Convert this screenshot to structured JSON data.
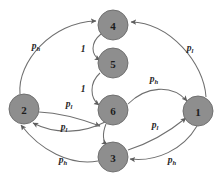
{
  "figure": {
    "type": "directed-graph-diagram",
    "background_color": "#ffffff",
    "node_fill_color": "#8e8e8e",
    "node_stroke_color": "#6a6a6a",
    "edge_color": "#6f6f6f",
    "label_color": "#262626"
  },
  "nodes": [
    {
      "id": "4",
      "label": "4",
      "x": 113,
      "y": 25,
      "r": 15
    },
    {
      "id": "5",
      "label": "5",
      "x": 113,
      "y": 63,
      "r": 15
    },
    {
      "id": "6",
      "label": "6",
      "x": 113,
      "y": 110,
      "r": 15
    },
    {
      "id": "2",
      "label": "2",
      "x": 24,
      "y": 109,
      "r": 15
    },
    {
      "id": "1",
      "label": "1",
      "x": 198,
      "y": 111,
      "r": 15
    },
    {
      "id": "3",
      "label": "3",
      "x": 113,
      "y": 157,
      "r": 15
    }
  ],
  "edges": [
    {
      "from": "2",
      "to": "4",
      "label_base": "p",
      "label_sub": "h",
      "label_x": 36,
      "label_y": 46
    },
    {
      "from": "1",
      "to": "4",
      "label_base": "p",
      "label_sub": "l",
      "label_x": 190,
      "label_y": 48
    },
    {
      "from": "4",
      "to": "5",
      "label_base": "1",
      "label_sub": "",
      "label_x": 83,
      "label_y": 49
    },
    {
      "from": "5",
      "to": "6",
      "label_base": "1",
      "label_sub": "",
      "label_x": 83,
      "label_y": 89
    },
    {
      "from": "6",
      "to": "1",
      "label_base": "p",
      "label_sub": "h",
      "label_x": 154,
      "label_y": 79
    },
    {
      "from": "2",
      "to": "6",
      "label_base": "p",
      "label_sub": "l",
      "label_x": 69,
      "label_y": 104
    },
    {
      "from": "6",
      "to": "2",
      "label_base": "p",
      "label_sub": "l",
      "label_x": 64,
      "label_y": 127
    },
    {
      "from": "3",
      "to": "1",
      "label_base": "p",
      "label_sub": "l",
      "label_x": 155,
      "label_y": 125
    },
    {
      "from": "3",
      "to": "2",
      "label_base": "p",
      "label_sub": "h",
      "label_x": 63,
      "label_y": 160
    },
    {
      "from": "1",
      "to": "3",
      "label_base": "p",
      "label_sub": "h",
      "label_x": 172,
      "label_y": 160
    },
    {
      "from": "6",
      "to": "3",
      "label_base": "",
      "label_sub": "",
      "label_x": 0,
      "label_y": 0
    }
  ],
  "edge_labels": {
    "p_high": "p",
    "p_high_sub": "h",
    "p_low": "p",
    "p_low_sub": "l",
    "one": "1"
  }
}
